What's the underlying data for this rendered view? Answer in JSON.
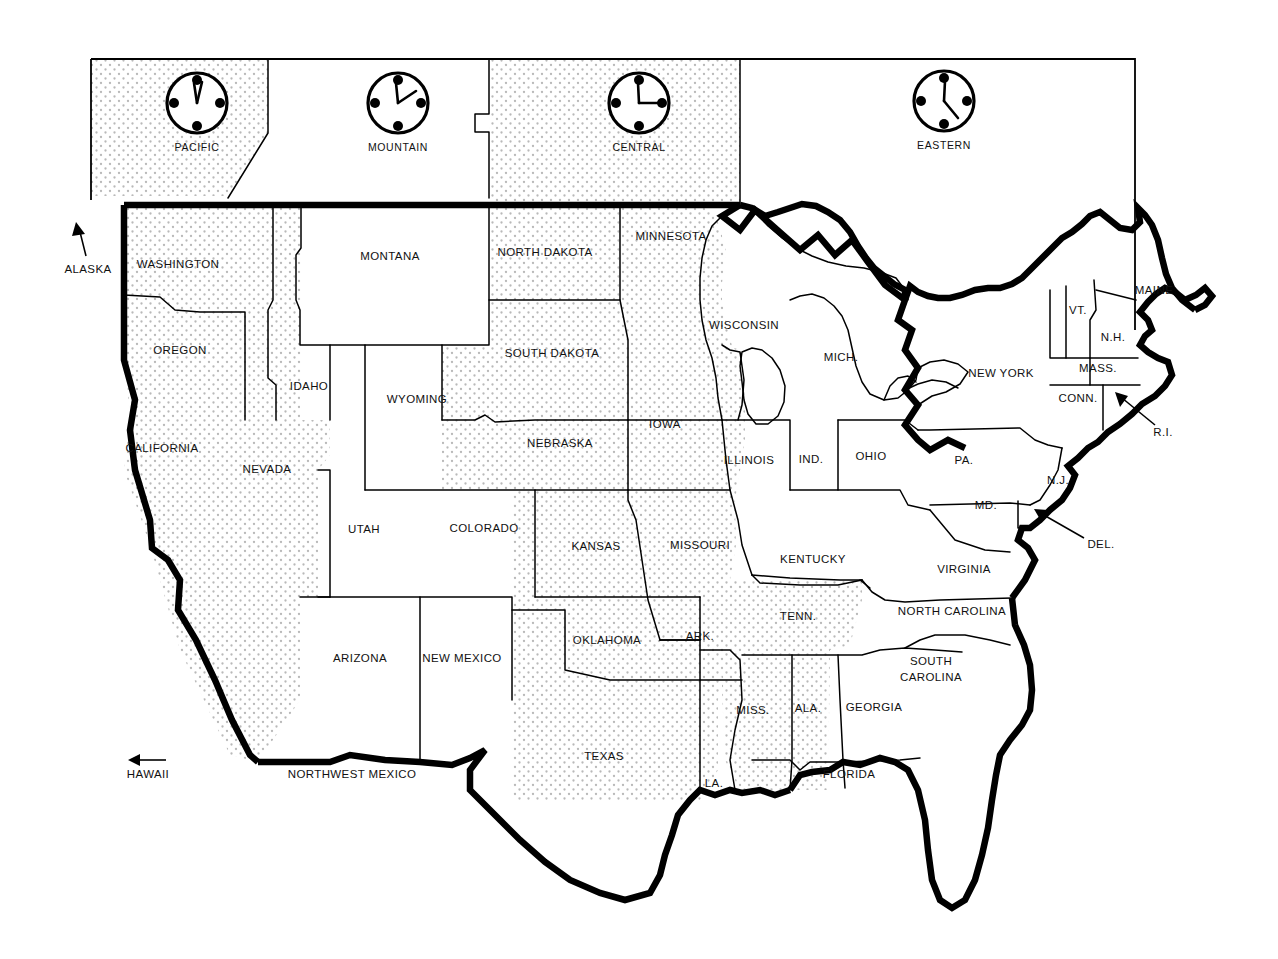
{
  "map": {
    "title": "United States Time Zones Map",
    "background_color": "#ffffff",
    "line_color": "#000000",
    "shade_color": "#cfcfcf"
  },
  "legend": {
    "zones": [
      {
        "name": "PACIFIC",
        "hour_angle": 3,
        "minute_angle": -8,
        "shaded": true
      },
      {
        "name": "MOUNTAIN",
        "hour_angle": -4,
        "minute_angle": 62,
        "shaded": false
      },
      {
        "name": "CENTRAL",
        "hour_angle": -2,
        "minute_angle": 90,
        "shaded": true
      },
      {
        "name": "EASTERN",
        "hour_angle": 2,
        "minute_angle": 126,
        "shaded": false
      }
    ],
    "dot_positions": [
      0,
      90,
      180,
      270
    ]
  },
  "states": [
    {
      "label": "WASHINGTON",
      "x": 178,
      "y": 265,
      "zone": "PACIFIC"
    },
    {
      "label": "OREGON",
      "x": 180,
      "y": 351,
      "zone": "PACIFIC"
    },
    {
      "label": "IDAHO",
      "x": 309,
      "y": 387,
      "zone": "MOUNTAIN"
    },
    {
      "label": "MONTANA",
      "x": 390,
      "y": 257,
      "zone": "MOUNTAIN"
    },
    {
      "label": "WYOMING",
      "x": 417,
      "y": 400,
      "zone": "MOUNTAIN"
    },
    {
      "label": "NORTH DAKOTA",
      "x": 545,
      "y": 253,
      "zone": "CENTRAL"
    },
    {
      "label": "SOUTH DAKOTA",
      "x": 552,
      "y": 354,
      "zone": "CENTRAL"
    },
    {
      "label": "MINNESOTA",
      "x": 671,
      "y": 237,
      "zone": "CENTRAL"
    },
    {
      "label": "WISCONSIN",
      "x": 744,
      "y": 326,
      "zone": "CENTRAL"
    },
    {
      "label": "MICH.",
      "x": 841,
      "y": 358,
      "zone": "EASTERN"
    },
    {
      "label": "CALIFORNIA",
      "x": 162,
      "y": 449,
      "zone": "PACIFIC"
    },
    {
      "label": "NEVADA",
      "x": 267,
      "y": 470,
      "zone": "PACIFIC"
    },
    {
      "label": "UTAH",
      "x": 364,
      "y": 530,
      "zone": "MOUNTAIN"
    },
    {
      "label": "COLORADO",
      "x": 484,
      "y": 529,
      "zone": "MOUNTAIN"
    },
    {
      "label": "NEBRASKA",
      "x": 560,
      "y": 444,
      "zone": "CENTRAL"
    },
    {
      "label": "IOWA",
      "x": 665,
      "y": 425,
      "zone": "CENTRAL"
    },
    {
      "label": "ILLINOIS",
      "x": 749,
      "y": 461,
      "zone": "CENTRAL"
    },
    {
      "label": "IND.",
      "x": 811,
      "y": 460,
      "zone": "EASTERN"
    },
    {
      "label": "OHIO",
      "x": 871,
      "y": 457,
      "zone": "EASTERN"
    },
    {
      "label": "PA.",
      "x": 964,
      "y": 461,
      "zone": "EASTERN"
    },
    {
      "label": "NEW YORK",
      "x": 1001,
      "y": 374,
      "zone": "EASTERN"
    },
    {
      "label": "MAINE",
      "x": 1154,
      "y": 291,
      "zone": "EASTERN"
    },
    {
      "label": "VT.",
      "x": 1078,
      "y": 311,
      "zone": "EASTERN"
    },
    {
      "label": "N.H.",
      "x": 1113,
      "y": 338,
      "zone": "EASTERN"
    },
    {
      "label": "MASS.",
      "x": 1098,
      "y": 369,
      "zone": "EASTERN"
    },
    {
      "label": "CONN.",
      "x": 1078,
      "y": 399,
      "zone": "EASTERN"
    },
    {
      "label": "N.J.",
      "x": 1058,
      "y": 481,
      "zone": "EASTERN"
    },
    {
      "label": "MD.",
      "x": 986,
      "y": 506,
      "zone": "EASTERN"
    },
    {
      "label": "KANSAS",
      "x": 596,
      "y": 547,
      "zone": "CENTRAL"
    },
    {
      "label": "MISSOURI",
      "x": 700,
      "y": 546,
      "zone": "CENTRAL"
    },
    {
      "label": "KENTUCKY",
      "x": 813,
      "y": 560,
      "zone": "CENTRAL"
    },
    {
      "label": "VIRGINIA",
      "x": 964,
      "y": 570,
      "zone": "EASTERN"
    },
    {
      "label": "NORTH CAROLINA",
      "x": 952,
      "y": 612,
      "zone": "EASTERN"
    },
    {
      "label": "TENN.",
      "x": 798,
      "y": 617,
      "zone": "CENTRAL"
    },
    {
      "label": "ARK.",
      "x": 700,
      "y": 637,
      "zone": "CENTRAL"
    },
    {
      "label": "OKLAHOMA",
      "x": 607,
      "y": 641,
      "zone": "CENTRAL"
    },
    {
      "label": "NEW MEXICO",
      "x": 462,
      "y": 659,
      "zone": "MOUNTAIN"
    },
    {
      "label": "ARIZONA",
      "x": 360,
      "y": 659,
      "zone": "MOUNTAIN"
    },
    {
      "label": "SOUTH",
      "x": 931,
      "y": 662,
      "zone": "EASTERN"
    },
    {
      "label": "CAROLINA",
      "x": 931,
      "y": 678,
      "zone": "EASTERN"
    },
    {
      "label": "MISS.",
      "x": 753,
      "y": 711,
      "zone": "CENTRAL"
    },
    {
      "label": "ALA.",
      "x": 808,
      "y": 709,
      "zone": "CENTRAL"
    },
    {
      "label": "GEORGIA",
      "x": 874,
      "y": 708,
      "zone": "EASTERN"
    },
    {
      "label": "TEXAS",
      "x": 604,
      "y": 757,
      "zone": "CENTRAL"
    },
    {
      "label": "LA.",
      "x": 714,
      "y": 784,
      "zone": "CENTRAL"
    },
    {
      "label": "FLORIDA",
      "x": 849,
      "y": 775,
      "zone": "EASTERN"
    }
  ],
  "callouts": [
    {
      "label": "ALASKA",
      "x": 88,
      "y": 270,
      "kind": "arrow-up"
    },
    {
      "label": "HAWAII",
      "x": 148,
      "y": 775,
      "kind": "arrow-left"
    },
    {
      "label": "NORTHWEST MEXICO",
      "x": 352,
      "y": 775,
      "kind": "border-label"
    },
    {
      "label": "R.I.",
      "x": 1163,
      "y": 433,
      "kind": "leader-arrow"
    },
    {
      "label": "DEL.",
      "x": 1101,
      "y": 545,
      "kind": "leader-arrow"
    }
  ]
}
